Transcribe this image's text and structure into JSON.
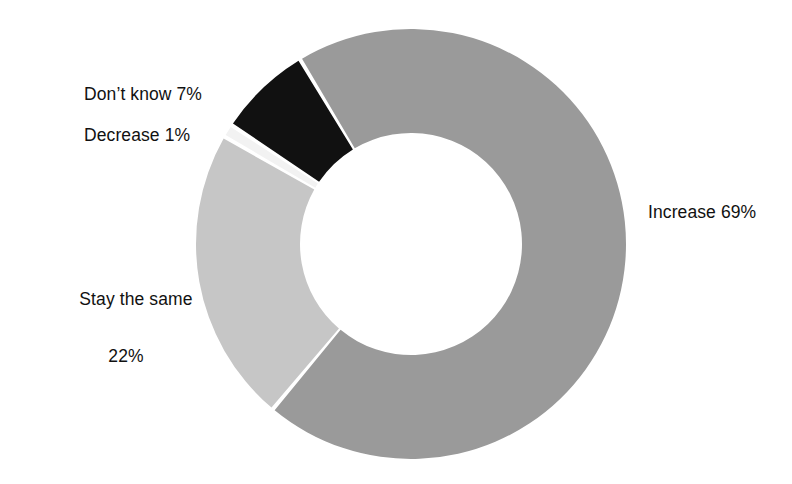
{
  "chart_data": {
    "type": "pie",
    "variant": "donut",
    "title": "",
    "subtitle": "",
    "xlabel": "",
    "ylabel": "",
    "legend": "none",
    "grid": false,
    "units": "percent",
    "categories": [
      "Increase",
      "Stay the same",
      "Decrease",
      "Don't know"
    ],
    "values": [
      69,
      22,
      1,
      7
    ],
    "labels": [
      "Increase 69%",
      "Stay the same 22%",
      "Decrease 1%",
      "Don't know 7%"
    ],
    "colors": [
      "#9a9a9a",
      "#c6c6c6",
      "#f2f2f2",
      "#111111"
    ],
    "start_angle_deg": -31,
    "direction": "clockwise",
    "slices": [
      {
        "name": "Increase",
        "value": 69,
        "label": "Increase 69%",
        "color": "#9a9a9a"
      },
      {
        "name": "Stay the same",
        "value": 22,
        "label": "Stay the same 22%",
        "color": "#c6c6c6"
      },
      {
        "name": "Decrease",
        "value": 1,
        "label": "Decrease 1%",
        "color": "#f2f2f2"
      },
      {
        "name": "Don't know",
        "value": 7,
        "label": "Don't know 7%",
        "color": "#111111"
      }
    ]
  },
  "callouts": {
    "increase": "Increase 69%",
    "stay_the_same_line1": "Stay the same",
    "stay_the_same_line2": "22%",
    "decrease": "Decrease 1%",
    "dont_know": "Don’t know 7%"
  },
  "geometry": {
    "center_x": 411,
    "center_y": 244,
    "outer_radius": 215,
    "inner_radius": 111
  },
  "style": {
    "background": "#ffffff",
    "text_color": "#111111",
    "slice_gap_color": "#ffffff"
  }
}
